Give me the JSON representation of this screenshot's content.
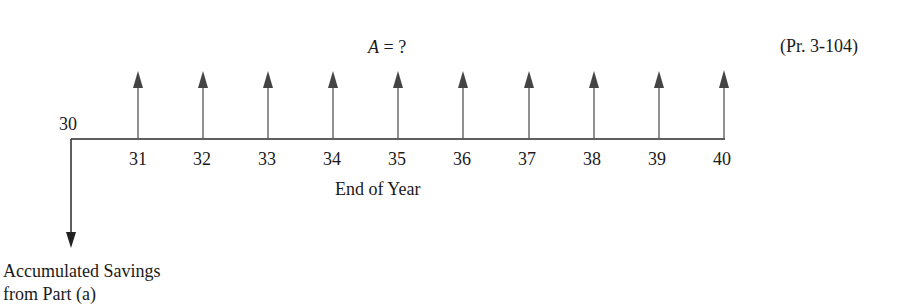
{
  "diagram": {
    "type": "cash-flow-diagram",
    "problem_label": "(Pr. 3-104)",
    "annuity_label_var": "A",
    "annuity_label_rest": " = ?",
    "start_label": "30",
    "axis_label": "End of Year",
    "years": [
      "31",
      "32",
      "33",
      "34",
      "35",
      "36",
      "37",
      "38",
      "39",
      "40"
    ],
    "down_arrow_label_line1": "Accumulated Savings",
    "down_arrow_label_line2": "from Part (a)",
    "colors": {
      "line": "#2a2a2a",
      "arrow": "#333333",
      "text": "#1a1a1a"
    }
  }
}
